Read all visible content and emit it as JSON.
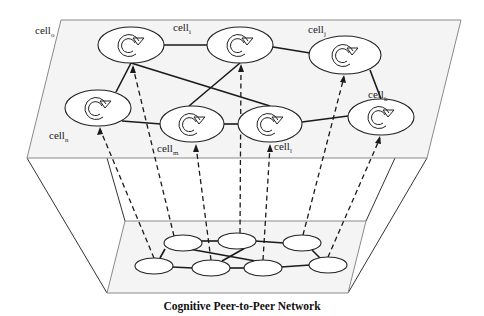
{
  "caption": "Cognitive Peer-to-Peer Network",
  "top_plane": {
    "cells": [
      {
        "id": "cell_a",
        "cx": 131,
        "cy": 45
      },
      {
        "id": "cell_b",
        "cx": 240,
        "cy": 45
      },
      {
        "id": "cell_c",
        "cx": 345,
        "cy": 55
      },
      {
        "id": "cell_d",
        "cx": 98,
        "cy": 108
      },
      {
        "id": "cell_e",
        "cx": 192,
        "cy": 124
      },
      {
        "id": "cell_f",
        "cx": 270,
        "cy": 124
      },
      {
        "id": "cell_g",
        "cx": 381,
        "cy": 117
      }
    ],
    "labels": [
      {
        "base": "cell",
        "sub": "o",
        "x": 35,
        "y": 34
      },
      {
        "base": "cell",
        "sub": "i",
        "x": 173,
        "y": 31
      },
      {
        "base": "cell",
        "sub": "j",
        "x": 308,
        "y": 33
      },
      {
        "base": "cell",
        "sub": "k",
        "x": 368,
        "y": 98
      },
      {
        "base": "cell",
        "sub": "n",
        "x": 49,
        "y": 139
      },
      {
        "base": "cell",
        "sub": "m",
        "x": 157,
        "y": 152
      },
      {
        "base": "cell",
        "sub": "l",
        "x": 274,
        "y": 150
      }
    ]
  },
  "bottom_plane": {
    "peers": [
      {
        "id": "peer_1",
        "cx": 183,
        "cy": 243
      },
      {
        "id": "peer_2",
        "cx": 237,
        "cy": 241
      },
      {
        "id": "peer_3",
        "cx": 302,
        "cy": 243
      },
      {
        "id": "peer_4",
        "cx": 154,
        "cy": 266
      },
      {
        "id": "peer_5",
        "cx": 211,
        "cy": 268
      },
      {
        "id": "peer_6",
        "cx": 263,
        "cy": 268
      },
      {
        "id": "peer_7",
        "cx": 328,
        "cy": 265
      }
    ]
  }
}
